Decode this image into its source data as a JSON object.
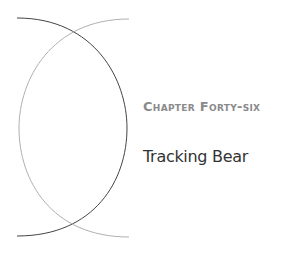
{
  "chapter": {
    "label": "Chapter Forty-six",
    "title": "Tracking Bear"
  },
  "colors": {
    "dark_arc": "#444444",
    "light_arc": "#b0b0b0",
    "label": "#8a8a8a",
    "title": "#333333"
  }
}
